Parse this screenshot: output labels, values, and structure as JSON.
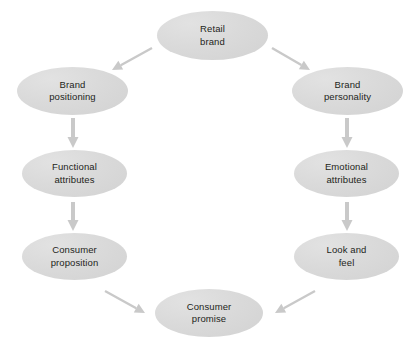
{
  "diagram": {
    "background_color": "#ffffff",
    "node_fill_color": "#d9d9d9",
    "arrow_color": "#c9c9c9",
    "text_color": "#231f20",
    "nodes": [
      {
        "id": "retail-brand",
        "label": "Retail\nbrand",
        "x": 157,
        "y": 11,
        "w": 111,
        "h": 49
      },
      {
        "id": "brand-positioning",
        "label": "Brand\npositioning",
        "x": 17,
        "y": 67,
        "w": 111,
        "h": 48
      },
      {
        "id": "brand-personality",
        "label": "Brand\npersonality",
        "x": 292,
        "y": 67,
        "w": 111,
        "h": 48
      },
      {
        "id": "functional-attributes",
        "label": "Functional\nattributes",
        "x": 22,
        "y": 150,
        "w": 105,
        "h": 47
      },
      {
        "id": "emotional-attributes",
        "label": "Emotional\nattributes",
        "x": 294,
        "y": 150,
        "w": 105,
        "h": 47
      },
      {
        "id": "consumer-proposition",
        "label": "Consumer\nproposition",
        "x": 22,
        "y": 233,
        "w": 105,
        "h": 47
      },
      {
        "id": "look-and-feel",
        "label": "Look and\nfeel",
        "x": 294,
        "y": 233,
        "w": 105,
        "h": 47
      },
      {
        "id": "consumer-promise",
        "label": "Consumer\npromise",
        "x": 155,
        "y": 289,
        "w": 108,
        "h": 48
      }
    ],
    "arrows": [
      {
        "id": "retail-brand-to-brand-positioning",
        "from": "retail-brand",
        "to": "brand-positioning",
        "x1": 152,
        "y1": 48,
        "x2": 112,
        "y2": 70,
        "kind": "diagonal"
      },
      {
        "id": "retail-brand-to-brand-personality",
        "from": "retail-brand",
        "to": "brand-personality",
        "x1": 272,
        "y1": 48,
        "x2": 310,
        "y2": 70,
        "kind": "diagonal"
      },
      {
        "id": "brand-positioning-to-functional",
        "from": "brand-positioning",
        "to": "functional-attributes",
        "x1": 73,
        "y1": 118,
        "x2": 73,
        "y2": 148,
        "kind": "vertical"
      },
      {
        "id": "brand-personality-to-emotional",
        "from": "brand-personality",
        "to": "emotional-attributes",
        "x1": 347,
        "y1": 118,
        "x2": 347,
        "y2": 148,
        "kind": "vertical"
      },
      {
        "id": "functional-to-consumer-proposition",
        "from": "functional-attributes",
        "to": "consumer-proposition",
        "x1": 73,
        "y1": 202,
        "x2": 73,
        "y2": 231,
        "kind": "vertical"
      },
      {
        "id": "emotional-to-look-and-feel",
        "from": "emotional-attributes",
        "to": "look-and-feel",
        "x1": 347,
        "y1": 202,
        "x2": 347,
        "y2": 231,
        "kind": "vertical"
      },
      {
        "id": "consumer-proposition-to-promise",
        "from": "consumer-proposition",
        "to": "consumer-promise",
        "x1": 105,
        "y1": 291,
        "x2": 145,
        "y2": 313,
        "kind": "diagonal"
      },
      {
        "id": "look-and-feel-to-promise",
        "from": "look-and-feel",
        "to": "consumer-promise",
        "x1": 315,
        "y1": 291,
        "x2": 275,
        "y2": 313,
        "kind": "diagonal"
      }
    ]
  }
}
